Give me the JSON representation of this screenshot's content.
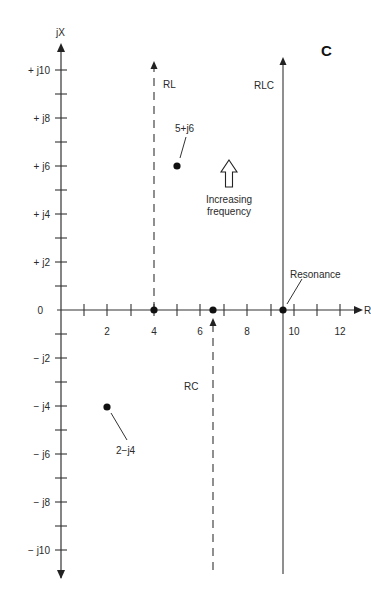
{
  "figure": {
    "panel_label": "C",
    "x_axis_label": "R",
    "y_axis_label": "jX",
    "x_ticks": [
      {
        "value": 2,
        "label": "2"
      },
      {
        "value": 4,
        "label": "4"
      },
      {
        "value": 6,
        "label": "6"
      },
      {
        "value": 8,
        "label": "8"
      },
      {
        "value": 10,
        "label": "10"
      },
      {
        "value": 12,
        "label": "12"
      }
    ],
    "y_ticks": [
      {
        "value": 10,
        "label": "+ j10"
      },
      {
        "value": 8,
        "label": "+ j8"
      },
      {
        "value": 6,
        "label": "+ j6"
      },
      {
        "value": 4,
        "label": "+ j4"
      },
      {
        "value": 2,
        "label": "+ j2"
      },
      {
        "value": 0,
        "label": "0"
      },
      {
        "value": -2,
        "label": "− j2"
      },
      {
        "value": -4,
        "label": "− j4"
      },
      {
        "value": -6,
        "label": "− j6"
      },
      {
        "value": -8,
        "label": "− j8"
      },
      {
        "value": -10,
        "label": "− j10"
      }
    ],
    "loci": [
      {
        "name": "RL",
        "label": "RL",
        "r": 4,
        "style": "dashed",
        "direction": "up"
      },
      {
        "name": "RC",
        "label": "RC",
        "r": 6.5,
        "style": "dashed",
        "direction": "up-from-bottom"
      },
      {
        "name": "RLC",
        "label": "RLC",
        "r": 9.5,
        "style": "solid",
        "direction": "up"
      }
    ],
    "points": [
      {
        "name": "point-5-j6",
        "label": "5+j6",
        "r": 5,
        "x": 6
      },
      {
        "name": "point-2-j4",
        "label": "2−j4",
        "r": 2,
        "x": -4
      },
      {
        "name": "point-rl-origin",
        "r": 4,
        "x": 0
      },
      {
        "name": "point-rc-origin",
        "r": 6.5,
        "x": 0
      },
      {
        "name": "point-resonance",
        "label": "Resonance",
        "r": 9.5,
        "x": 0
      }
    ],
    "annotation": {
      "line1": "Increasing",
      "line2": "frequency"
    }
  }
}
